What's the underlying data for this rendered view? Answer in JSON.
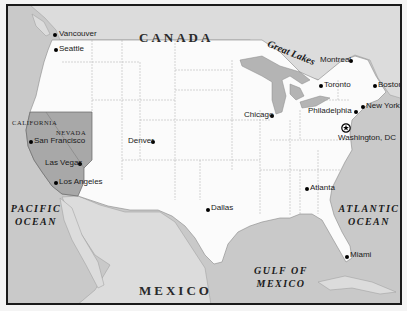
{
  "map": {
    "colors": {
      "water": "#c9c9c9",
      "land_us": "#fbfbfb",
      "land_foreign": "#dcdcdc",
      "highlight_states": "#a8a8a8",
      "frame": "#1a1a1a",
      "border_line": "#9a9a9a"
    },
    "regions": {
      "canada": "CANADA",
      "mexico": "MEXICO"
    },
    "water_bodies": {
      "great_lakes": "Great Lakes",
      "pacific_line1": "PACIFIC",
      "pacific_line2": "OCEAN",
      "atlantic_line1": "ATLANTIC",
      "atlantic_line2": "OCEAN",
      "gulf_line1": "GULF OF",
      "gulf_line2": "MEXICO"
    },
    "highlighted_states": [
      "CALIFORNIA",
      "NEVADA"
    ],
    "cities": [
      {
        "name": "Vancouver",
        "x": 53,
        "y": 33
      },
      {
        "name": "Seattle",
        "x": 54,
        "y": 48
      },
      {
        "name": "San Francisco",
        "x": 29,
        "y": 140
      },
      {
        "name": "Las Vegas",
        "x": 78,
        "y": 162
      },
      {
        "name": "Los Angeles",
        "x": 54,
        "y": 181
      },
      {
        "name": "Denver",
        "x": 151,
        "y": 140
      },
      {
        "name": "Chicago",
        "x": 270,
        "y": 114
      },
      {
        "name": "Dallas",
        "x": 206,
        "y": 208
      },
      {
        "name": "Atlanta",
        "x": 305,
        "y": 187
      },
      {
        "name": "Montreal",
        "x": 349,
        "y": 58
      },
      {
        "name": "Toronto",
        "x": 319,
        "y": 83
      },
      {
        "name": "Boston",
        "x": 373,
        "y": 83
      },
      {
        "name": "New York",
        "x": 361,
        "y": 104
      },
      {
        "name": "Philadelphia",
        "x": 354,
        "y": 110
      },
      {
        "name": "Miami",
        "x": 345,
        "y": 254
      }
    ],
    "capital": {
      "name": "Washington, DC",
      "x": 346,
      "y": 127,
      "icon": "star-in-circle-icon"
    }
  }
}
